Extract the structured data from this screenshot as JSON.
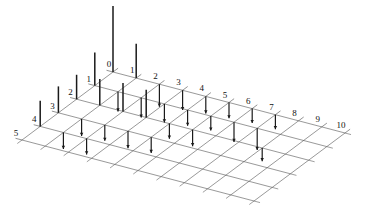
{
  "figure": {
    "type": "stem3",
    "title": "",
    "background": "#ffffff",
    "grid_color": "#555555",
    "stem_color": "#1a1a1a",
    "label_color": "#111111"
  },
  "axes": {
    "x_axis": {
      "name": "x-axis",
      "direction": "right-back",
      "min": 0,
      "max": 10,
      "tick_labels": [
        "0",
        "1",
        "2",
        "3",
        "4",
        "5",
        "6",
        "7",
        "8",
        "9",
        "10"
      ]
    },
    "y_axis": {
      "name": "y-axis",
      "direction": "left-back",
      "min": 0,
      "max": 5,
      "tick_labels": [
        "0",
        "1",
        "2",
        "3",
        "4",
        "5"
      ]
    },
    "z_axis": {
      "name": "z-axis",
      "direction": "vertical",
      "tick_labels": []
    }
  },
  "chart_data": {
    "type": "scatter",
    "plot_style": "stem3",
    "title": "",
    "xlabel": "",
    "ylabel": "",
    "zlabel": "",
    "xlim": [
      0,
      10
    ],
    "ylim": [
      0,
      5
    ],
    "zlim": [
      -0.55,
      1.0
    ],
    "grid": true,
    "legend": null,
    "x_tick_labels": [
      "0",
      "1",
      "2",
      "3",
      "4",
      "5",
      "6",
      "7",
      "8",
      "9",
      "10"
    ],
    "y_tick_labels": [
      "0",
      "1",
      "2",
      "3",
      "4",
      "5"
    ],
    "points": [
      {
        "x": 0,
        "y": 0,
        "z": 1.0
      },
      {
        "x": 1,
        "y": 0,
        "z": 0.52
      },
      {
        "x": 0,
        "y": 1,
        "z": 0.5
      },
      {
        "x": 1,
        "y": 1,
        "z": -0.3
      },
      {
        "x": 2,
        "y": 0,
        "z": -0.34
      },
      {
        "x": 0,
        "y": 2,
        "z": 0.37
      },
      {
        "x": 2,
        "y": 1,
        "z": -0.3
      },
      {
        "x": 1,
        "y": 2,
        "z": 0.4
      },
      {
        "x": 0,
        "y": 3,
        "z": 0.4
      },
      {
        "x": 3,
        "y": 0,
        "z": -0.3
      },
      {
        "x": 3,
        "y": 1,
        "z": -0.28
      },
      {
        "x": 2,
        "y": 2,
        "z": 0.43
      },
      {
        "x": 1,
        "y": 3,
        "z": -0.26
      },
      {
        "x": 0,
        "y": 4,
        "z": 0.39
      },
      {
        "x": 4,
        "y": 0,
        "z": -0.26
      },
      {
        "x": 4,
        "y": 1,
        "z": -0.24
      },
      {
        "x": 3,
        "y": 2,
        "z": 0.42
      },
      {
        "x": 2,
        "y": 3,
        "z": -0.24
      },
      {
        "x": 1,
        "y": 4,
        "z": -0.25
      },
      {
        "x": 5,
        "y": 0,
        "z": -0.24
      },
      {
        "x": 5,
        "y": 1,
        "z": -0.22
      },
      {
        "x": 4,
        "y": 2,
        "z": -0.23
      },
      {
        "x": 3,
        "y": 3,
        "z": -0.26
      },
      {
        "x": 2,
        "y": 4,
        "z": -0.24
      },
      {
        "x": 6,
        "y": 0,
        "z": -0.22
      },
      {
        "x": 6,
        "y": 1,
        "z": -0.3
      },
      {
        "x": 5,
        "y": 2,
        "z": -0.25
      },
      {
        "x": 4,
        "y": 3,
        "z": -0.24
      },
      {
        "x": 7,
        "y": 0,
        "z": -0.22
      },
      {
        "x": 7,
        "y": 1,
        "z": -0.33
      },
      {
        "x": 8,
        "y": 2,
        "z": -0.2
      }
    ]
  },
  "stems": [
    {
      "label": "stem-0-0"
    },
    {
      "label": "stem-1-0"
    },
    {
      "label": "stem-0-1"
    }
  ]
}
